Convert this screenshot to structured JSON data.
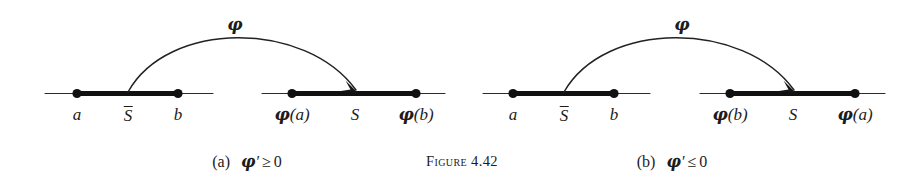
{
  "figure": {
    "number_label": "Figure 4.42",
    "number_word": "Figure",
    "number_value": "4.42",
    "background_color": "#ffffff",
    "ink_color": "#111111"
  },
  "panels": [
    {
      "id": "a",
      "caption_tag": "(a)",
      "caption_condition": "φ′ ≥ 0",
      "caption_symbol": "φ",
      "caption_prime": "′",
      "caption_relation": "≥",
      "caption_value": "0",
      "map_label": "φ",
      "domain_line": {
        "name": "domain-axis",
        "left_label": "a",
        "interval_label": "S̄",
        "interval_label_base": "S",
        "right_label": "b"
      },
      "codomain_line": {
        "name": "codomain-axis",
        "left_label": "φ(a)",
        "interval_label": "S",
        "right_label": "φ(b)"
      },
      "orientation": "increasing"
    },
    {
      "id": "b",
      "caption_tag": "(b)",
      "caption_condition": "φ′ ≤ 0",
      "caption_symbol": "φ",
      "caption_prime": "′",
      "caption_relation": "≤",
      "caption_value": "0",
      "map_label": "φ",
      "domain_line": {
        "name": "domain-axis",
        "left_label": "a",
        "interval_label": "S̄",
        "interval_label_base": "S",
        "right_label": "b"
      },
      "codomain_line": {
        "name": "codomain-axis",
        "left_label": "φ(b)",
        "interval_label": "S",
        "right_label": "φ(a)"
      },
      "orientation": "decreasing"
    }
  ]
}
